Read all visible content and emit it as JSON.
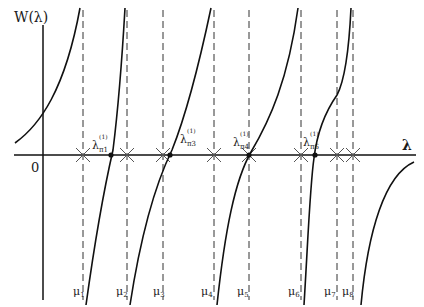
{
  "figure": {
    "y_axis_label": "W(λ)",
    "x_axis_label": "λ",
    "origin_label": "0",
    "poles": [
      {
        "label": "μ",
        "sub": "1",
        "x": 83
      },
      {
        "label": "μ",
        "sub": "2",
        "x": 127
      },
      {
        "label": "μ",
        "sub": "3",
        "x": 163
      },
      {
        "label": "μ",
        "sub": "4",
        "x": 214
      },
      {
        "label": "μ",
        "sub": "5",
        "x": 249
      },
      {
        "label": "μ",
        "sub": "6",
        "x": 301
      },
      {
        "label": "μ",
        "sub": "7",
        "x": 337
      },
      {
        "label": "μ",
        "sub": "8",
        "x": 353
      }
    ],
    "roots": [
      {
        "label": "λ",
        "sup": "(1)",
        "sub": "π1",
        "x": 111
      },
      {
        "label": "λ",
        "sup": "(1)",
        "sub": "π3",
        "x": 170
      },
      {
        "label": "λ",
        "sup": "(1)",
        "sub": "π4",
        "x": 249
      },
      {
        "label": "λ",
        "sup": "(1)",
        "sub": "π6",
        "x": 315
      }
    ]
  }
}
